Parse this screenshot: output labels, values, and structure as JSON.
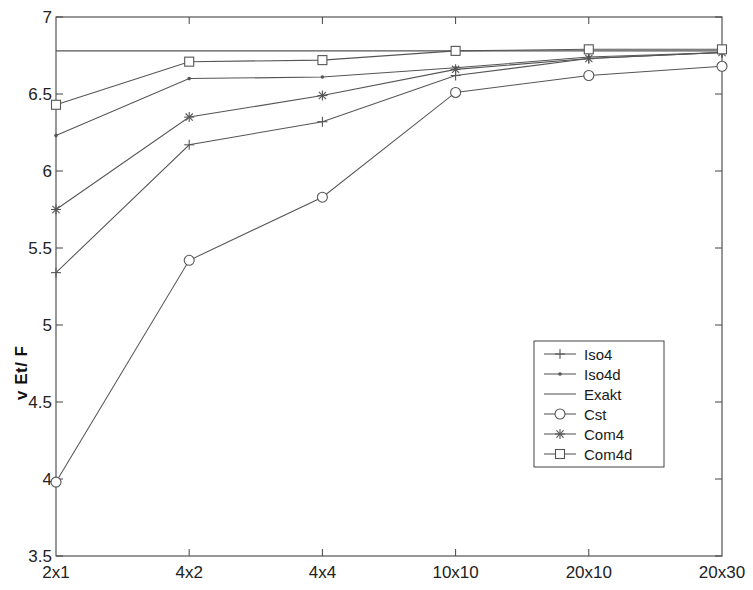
{
  "chart_data": {
    "type": "line",
    "title": "",
    "xlabel": "",
    "ylabel": "v Et/ F",
    "categories": [
      "2x1",
      "4x2",
      "4x4",
      "10x10",
      "20x10",
      "20x30"
    ],
    "ylim": [
      3.5,
      7.0
    ],
    "yticks": [
      "3.5",
      "4",
      "4.5",
      "5",
      "5.5",
      "6",
      "6.5",
      "7"
    ],
    "ytick_values": [
      3.5,
      4,
      4.5,
      5,
      5.5,
      6,
      6.5,
      7
    ],
    "grid": false,
    "legend_position": "lower right",
    "series": [
      {
        "name": "Iso4",
        "marker": "plus",
        "values": [
          5.34,
          6.17,
          6.32,
          6.62,
          6.73,
          6.77
        ]
      },
      {
        "name": "Iso4d",
        "marker": "dot",
        "values": [
          6.23,
          6.6,
          6.61,
          6.67,
          6.74,
          6.77
        ]
      },
      {
        "name": "Exakt",
        "marker": "none",
        "values": [
          6.78,
          6.78,
          6.78,
          6.78,
          6.78,
          6.78
        ]
      },
      {
        "name": "Cst",
        "marker": "circle",
        "values": [
          3.98,
          5.42,
          5.83,
          6.51,
          6.62,
          6.68
        ]
      },
      {
        "name": "Com4",
        "marker": "star",
        "values": [
          5.75,
          6.35,
          6.49,
          6.66,
          6.73,
          6.77
        ]
      },
      {
        "name": "Com4d",
        "marker": "square",
        "values": [
          6.43,
          6.71,
          6.72,
          6.78,
          6.79,
          6.79
        ]
      }
    ],
    "legend_entries": [
      "Iso4",
      "Iso4d",
      "Exakt",
      "Cst",
      "Com4",
      "Com4d"
    ],
    "line_color": "#555555",
    "axis_color": "#444444"
  }
}
